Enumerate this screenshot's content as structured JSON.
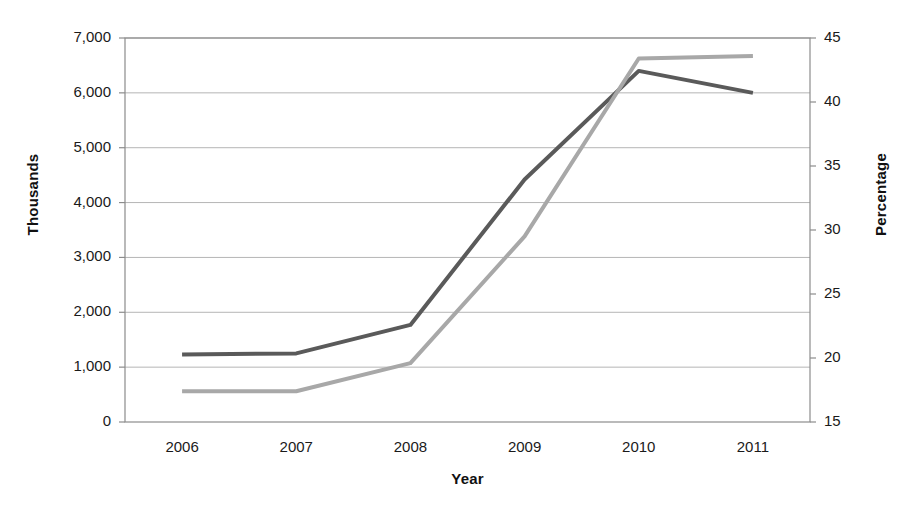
{
  "chart_data": {
    "type": "line",
    "title": "",
    "xlabel": "Year",
    "ylabel": "Thousands",
    "y2label": "Percentage",
    "categories": [
      "2006",
      "2007",
      "2008",
      "2009",
      "2010",
      "2011"
    ],
    "x": [
      2006,
      2007,
      2008,
      2009,
      2010,
      2011
    ],
    "ylim": [
      0,
      7000
    ],
    "y2lim": [
      15,
      45
    ],
    "yticks": [
      "0",
      "1,000",
      "2,000",
      "3,000",
      "4,000",
      "5,000",
      "6,000",
      "7,000"
    ],
    "ytick_values": [
      0,
      1000,
      2000,
      3000,
      4000,
      5000,
      6000,
      7000
    ],
    "y2ticks": [
      "15",
      "20",
      "25",
      "30",
      "35",
      "40",
      "45"
    ],
    "y2tick_values": [
      15,
      20,
      25,
      30,
      35,
      40,
      45
    ],
    "grid": true,
    "grid_axis": "y",
    "legend": "none",
    "series": [
      {
        "name": "Thousands",
        "axis": "left",
        "color": "#5a5a5a",
        "values": [
          1230,
          1250,
          1770,
          4420,
          6400,
          6000
        ]
      },
      {
        "name": "Percentage",
        "axis": "right",
        "color": "#a8a8a8",
        "values": [
          17.4,
          17.4,
          19.6,
          29.5,
          43.4,
          43.6
        ]
      }
    ]
  },
  "style": {
    "plot_border_color": "#8c8c8c",
    "grid_color": "#b5b5b5",
    "background": "#ffffff",
    "dark_series_color": "#5a5a5a",
    "light_series_color": "#a8a8a8",
    "line_width": 4
  },
  "plot_geometry": {
    "left": 125,
    "right": 810,
    "top": 38,
    "bottom": 422
  }
}
